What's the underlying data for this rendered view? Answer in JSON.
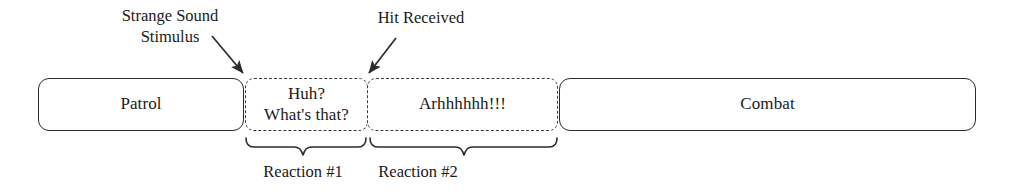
{
  "diagram": {
    "background_color": "#ffffff",
    "stroke_color": "#2b2b2b"
  },
  "states": [
    {
      "id": "patrol",
      "label": "Patrol",
      "style": "solid"
    },
    {
      "id": "reaction1",
      "label": "Huh?\nWhat's that?",
      "style": "dashed"
    },
    {
      "id": "reaction2",
      "label": "Arhhhhhh!!!",
      "style": "dashed"
    },
    {
      "id": "combat",
      "label": "Combat",
      "style": "solid"
    }
  ],
  "annotations": [
    {
      "id": "stimulus",
      "label": "Strange Sound\nStimulus",
      "arrow": "down-right"
    },
    {
      "id": "hit",
      "label": "Hit Received",
      "arrow": "down-left"
    }
  ],
  "braces": [
    {
      "id": "reaction1",
      "label": "Reaction #1"
    },
    {
      "id": "reaction2",
      "label": "Reaction #2"
    }
  ]
}
